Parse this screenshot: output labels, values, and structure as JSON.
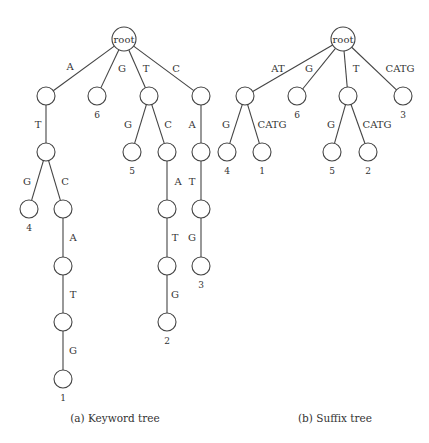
{
  "figure": {
    "keyword_tree": {
      "caption": "(a) Keyword tree",
      "caption_pos": [
        115,
        422
      ],
      "root_radius": 12,
      "node_radius": 9,
      "nodes": [
        {
          "id": "r",
          "x": 124,
          "y": 39,
          "label": "root",
          "is_root": true
        },
        {
          "id": "a",
          "x": 46,
          "y": 96
        },
        {
          "id": "g",
          "x": 97,
          "y": 96,
          "leaf": "6"
        },
        {
          "id": "t",
          "x": 149,
          "y": 96
        },
        {
          "id": "c",
          "x": 201,
          "y": 96
        },
        {
          "id": "at",
          "x": 46,
          "y": 152
        },
        {
          "id": "tg",
          "x": 132,
          "y": 152,
          "leaf": "5"
        },
        {
          "id": "tc",
          "x": 167,
          "y": 152
        },
        {
          "id": "ca",
          "x": 201,
          "y": 152
        },
        {
          "id": "atg",
          "x": 29,
          "y": 209,
          "leaf": "4"
        },
        {
          "id": "atc",
          "x": 63,
          "y": 209
        },
        {
          "id": "tca",
          "x": 167,
          "y": 209
        },
        {
          "id": "cat",
          "x": 201,
          "y": 209
        },
        {
          "id": "atca",
          "x": 63,
          "y": 266
        },
        {
          "id": "tcat",
          "x": 167,
          "y": 266
        },
        {
          "id": "catg",
          "x": 201,
          "y": 266,
          "leaf": "3"
        },
        {
          "id": "atcat",
          "x": 63,
          "y": 322
        },
        {
          "id": "tcatg",
          "x": 167,
          "y": 322,
          "leaf": "2"
        },
        {
          "id": "atcatg",
          "x": 63,
          "y": 379,
          "leaf": "1"
        }
      ],
      "edges": [
        {
          "from": "r",
          "to": "a",
          "label": "A",
          "lx": 70,
          "ly": 70
        },
        {
          "from": "r",
          "to": "g",
          "label": "G",
          "lx": 122,
          "ly": 72
        },
        {
          "from": "r",
          "to": "t",
          "label": "T",
          "lx": 146,
          "ly": 72
        },
        {
          "from": "r",
          "to": "c",
          "label": "C",
          "lx": 176,
          "ly": 72
        },
        {
          "from": "a",
          "to": "at",
          "label": "T",
          "lx": 38,
          "ly": 128
        },
        {
          "from": "t",
          "to": "tg",
          "label": "G",
          "lx": 128,
          "ly": 128
        },
        {
          "from": "t",
          "to": "tc",
          "label": "C",
          "lx": 168,
          "ly": 128
        },
        {
          "from": "c",
          "to": "ca",
          "label": "A",
          "lx": 192,
          "ly": 128
        },
        {
          "from": "at",
          "to": "atg",
          "label": "G",
          "lx": 27,
          "ly": 185
        },
        {
          "from": "at",
          "to": "atc",
          "label": "C",
          "lx": 65,
          "ly": 185
        },
        {
          "from": "tc",
          "to": "tca",
          "label": "A",
          "lx": 178,
          "ly": 185
        },
        {
          "from": "ca",
          "to": "cat",
          "label": "T",
          "lx": 192,
          "ly": 185
        },
        {
          "from": "atc",
          "to": "atca",
          "label": "A",
          "lx": 73,
          "ly": 241
        },
        {
          "from": "tca",
          "to": "tcat",
          "label": "T",
          "lx": 175,
          "ly": 241
        },
        {
          "from": "cat",
          "to": "catg",
          "label": "G",
          "lx": 192,
          "ly": 241
        },
        {
          "from": "atca",
          "to": "atcat",
          "label": "T",
          "lx": 73,
          "ly": 298
        },
        {
          "from": "tcat",
          "to": "tcatg",
          "label": "G",
          "lx": 175,
          "ly": 298
        },
        {
          "from": "atcat",
          "to": "atcatg",
          "label": "G",
          "lx": 73,
          "ly": 354
        }
      ]
    },
    "suffix_tree": {
      "caption": "(b) Suffix tree",
      "caption_pos": [
        335,
        422
      ],
      "root_radius": 12,
      "node_radius": 9,
      "nodes": [
        {
          "id": "r",
          "x": 343,
          "y": 39,
          "label": "root",
          "is_root": true
        },
        {
          "id": "at",
          "x": 245,
          "y": 96
        },
        {
          "id": "g",
          "x": 297,
          "y": 96,
          "leaf": "6"
        },
        {
          "id": "t",
          "x": 348,
          "y": 96
        },
        {
          "id": "catg",
          "x": 403,
          "y": 96,
          "leaf": "3"
        },
        {
          "id": "atg",
          "x": 227,
          "y": 152,
          "leaf": "4"
        },
        {
          "id": "atcatg",
          "x": 262,
          "y": 152,
          "leaf": "1"
        },
        {
          "id": "tg",
          "x": 332,
          "y": 152,
          "leaf": "5"
        },
        {
          "id": "tcatg",
          "x": 368,
          "y": 152,
          "leaf": "2"
        }
      ],
      "edges": [
        {
          "from": "r",
          "to": "at",
          "label": "AT",
          "lx": 278,
          "ly": 72
        },
        {
          "from": "r",
          "to": "g",
          "label": "G",
          "lx": 309,
          "ly": 72
        },
        {
          "from": "r",
          "to": "t",
          "label": "T",
          "lx": 356,
          "ly": 72
        },
        {
          "from": "r",
          "to": "catg",
          "label": "CATG",
          "lx": 400,
          "ly": 72
        },
        {
          "from": "at",
          "to": "atg",
          "label": "G",
          "lx": 226,
          "ly": 128
        },
        {
          "from": "at",
          "to": "atcatg",
          "label": "CATG",
          "lx": 272,
          "ly": 128
        },
        {
          "from": "t",
          "to": "tg",
          "label": "G",
          "lx": 331,
          "ly": 128
        },
        {
          "from": "t",
          "to": "tcatg",
          "label": "CATG",
          "lx": 377,
          "ly": 128
        }
      ]
    }
  }
}
